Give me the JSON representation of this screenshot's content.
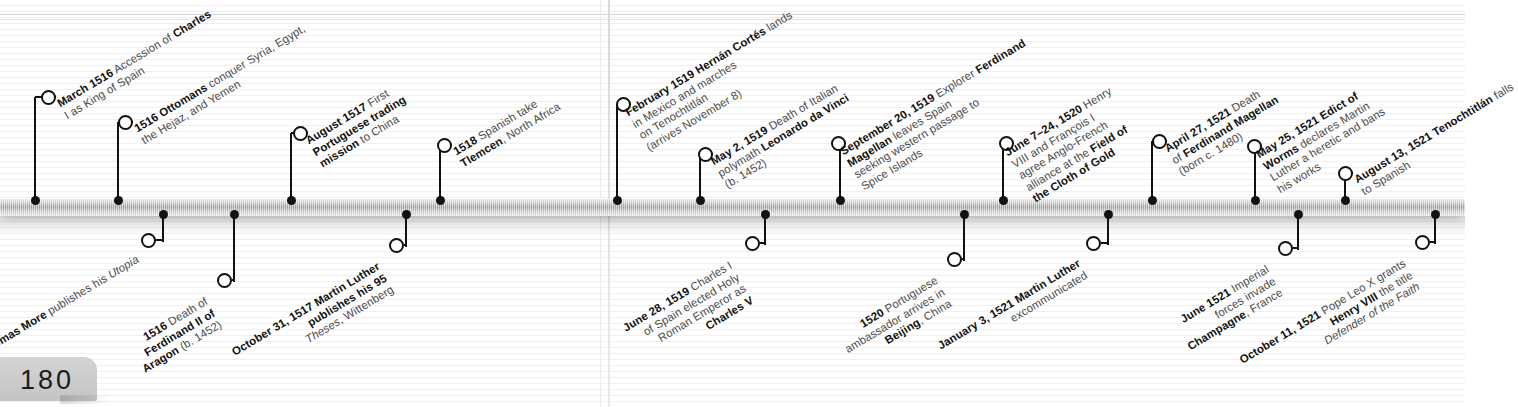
{
  "page": {
    "number": "180"
  },
  "timeline": {
    "orientation": "horizontal",
    "axis_color": "#9f9f9f",
    "accent_color": "#111111",
    "events": [
      {
        "id": "march-1516-charles",
        "side": "above",
        "dot_x": 35,
        "ring_x": 48,
        "ring_y": 97,
        "label_x": 62,
        "label_y": 97,
        "date": "March 1516",
        "lines": [
          "Accession of Charles",
          "I as King of Spain"
        ],
        "bold_spans": [
          "March 1516",
          "Charles"
        ]
      },
      {
        "id": "1516-ottomans",
        "side": "above",
        "dot_x": 118,
        "ring_x": 125,
        "ring_y": 122,
        "label_x": 139,
        "label_y": 122,
        "date": "1516 Ottomans",
        "lines": [
          "conquer Syria, Egypt,",
          "the Hejaz, and Yemen"
        ],
        "bold_spans": [
          "1516 Ottomans"
        ]
      },
      {
        "id": "august-1517-portuguese",
        "side": "above",
        "dot_x": 291,
        "ring_x": 300,
        "ring_y": 133,
        "label_x": 314,
        "label_y": 133,
        "date": "August 1517",
        "lines": [
          "First",
          "Portuguese trading",
          "mission to China"
        ],
        "bold_spans": [
          "August 1517",
          "Portuguese trading",
          "mission"
        ]
      },
      {
        "id": "1518-tlemcen",
        "side": "above",
        "dot_x": 440,
        "ring_x": 444,
        "ring_y": 145,
        "label_x": 458,
        "label_y": 145,
        "date": "1518",
        "lines": [
          "Spanish take",
          "Tlemcen, North Africa"
        ],
        "bold_spans": [
          "1518",
          "Tlemcen"
        ]
      },
      {
        "id": "february-1519-cortes",
        "side": "above",
        "dot_x": 617,
        "ring_x": 623,
        "ring_y": 104,
        "label_x": 637,
        "label_y": 104,
        "date": "February 1519",
        "lines": [
          "Hernán Cortés lands",
          "in Mexico and marches",
          "on Tenochtitlán",
          "(arrives November 8)"
        ],
        "bold_spans": [
          "February 1519",
          "Hernán Cortés"
        ]
      },
      {
        "id": "may-2-1519-davinci",
        "side": "above",
        "dot_x": 700,
        "ring_x": 705,
        "ring_y": 154,
        "label_x": 719,
        "label_y": 154,
        "date": "May 2, 1519",
        "lines": [
          "Death of Italian",
          "polymath Leonardo da Vinci",
          "(b. 1452)"
        ],
        "bold_spans": [
          "May 2, 1519",
          "Leonardo da Vinci"
        ]
      },
      {
        "id": "september-20-1519-magellan",
        "side": "above",
        "dot_x": 840,
        "ring_x": 838,
        "ring_y": 143,
        "label_x": 852,
        "label_y": 143,
        "date": "September 20, 1519",
        "lines": [
          "Explorer Ferdinand",
          "Magellan leaves Spain",
          "seeking western passage to",
          "Spice Islands"
        ],
        "bold_spans": [
          "September 20, 1519",
          "Ferdinand",
          "Magellan"
        ]
      },
      {
        "id": "june-7-24-1520-cloth-of-gold",
        "side": "above",
        "dot_x": 1003,
        "ring_x": 1006,
        "ring_y": 143,
        "label_x": 1020,
        "label_y": 143,
        "date": "June 7–24, 1520",
        "lines": [
          "Henry",
          "VIII and François I",
          "agree Anglo-French",
          "alliance at the Field of",
          "the Cloth of Gold"
        ],
        "bold_spans": [
          "June 7–24, 1520",
          "Field of",
          "the Cloth of Gold"
        ]
      },
      {
        "id": "april-27-1521-magellan-death",
        "side": "above",
        "dot_x": 1152,
        "ring_x": 1159,
        "ring_y": 141,
        "label_x": 1173,
        "label_y": 141,
        "date": "April 27, 1521",
        "lines": [
          "Death",
          "of Ferdinand Magellan",
          "(born c. 1480)"
        ],
        "bold_spans": [
          "April 27, 1521",
          "Ferdinand Magellan"
        ]
      },
      {
        "id": "may-25-1521-edict-of-worms",
        "side": "above",
        "dot_x": 1255,
        "ring_x": 1254,
        "ring_y": 146,
        "label_x": 1268,
        "label_y": 146,
        "date": "May 25, 1521",
        "lines": [
          "Edict of",
          "Worms declares Martin",
          "Luther a heretic and bans",
          "his works"
        ],
        "bold_spans": [
          "May 25, 1521",
          "Edict of",
          "Worms"
        ]
      },
      {
        "id": "august-13-1521-tenochtitlan",
        "side": "above",
        "dot_x": 1345,
        "ring_x": 1345,
        "ring_y": 173,
        "label_x": 1359,
        "label_y": 173,
        "date": "August 13, 1521",
        "lines": [
          "Tenochtitlán falls",
          "to Spanish"
        ],
        "bold_spans": [
          "August 13, 1521",
          "Tenochtitlán"
        ]
      },
      {
        "id": "1516-thomas-more-utopia",
        "side": "below",
        "dot_x": 163,
        "ring_x": 148,
        "ring_y": 240,
        "label_x": 138,
        "label_y": 252,
        "date": "1516 Thomas More",
        "lines": [
          "publishes his Utopia"
        ],
        "bold_spans": [
          "1516 Thomas More"
        ],
        "italic_spans": [
          "Utopia"
        ]
      },
      {
        "id": "1516-ferdinand-ii-death",
        "side": "below",
        "dot_x": 234,
        "ring_x": 224,
        "ring_y": 280,
        "label_x": 214,
        "label_y": 292,
        "date": "1516",
        "lines": [
          "Death of",
          "Ferdinand II of",
          "Aragon (b. 1452)"
        ],
        "bold_spans": [
          "1516",
          "Ferdinand II of",
          "Aragon"
        ]
      },
      {
        "id": "october-31-1517-luther-theses",
        "side": "below",
        "dot_x": 406,
        "ring_x": 396,
        "ring_y": 245,
        "label_x": 386,
        "label_y": 257,
        "date": "October 31, 1517",
        "lines": [
          "Martin Luther",
          "publishes his 95",
          "Theses, Wittenberg"
        ],
        "bold_spans": [
          "October 31, 1517",
          "Martin Luther",
          "publishes his 95"
        ],
        "italic_spans": [
          "Theses"
        ]
      },
      {
        "id": "june-28-1519-charles-v",
        "side": "below",
        "dot_x": 765,
        "ring_x": 752,
        "ring_y": 243,
        "label_x": 742,
        "label_y": 255,
        "date": "June 28, 1519",
        "lines": [
          "Charles I",
          "of Spain elected Holy",
          "Roman Emperor as",
          "Charles V"
        ],
        "bold_spans": [
          "June 28, 1519",
          "Charles V"
        ]
      },
      {
        "id": "1520-portuguese-beijing",
        "side": "below",
        "dot_x": 964,
        "ring_x": 954,
        "ring_y": 259,
        "label_x": 944,
        "label_y": 271,
        "date": "1520",
        "lines": [
          "Portuguese",
          "ambassador arrives in",
          "Beijing, China"
        ],
        "bold_spans": [
          "1520",
          "Beijing"
        ]
      },
      {
        "id": "january-3-1521-luther-excommunicated",
        "side": "below",
        "dot_x": 1108,
        "ring_x": 1093,
        "ring_y": 243,
        "label_x": 1083,
        "label_y": 255,
        "date": "January 3, 1521",
        "lines": [
          "Martin Luther",
          "excommunicated"
        ],
        "bold_spans": [
          "January 3, 1521",
          "Martin Luther"
        ]
      },
      {
        "id": "june-1521-champagne",
        "side": "below",
        "dot_x": 1298,
        "ring_x": 1285,
        "ring_y": 248,
        "label_x": 1275,
        "label_y": 260,
        "date": "June 1521",
        "lines": [
          "Imperial",
          "forces invade",
          "Champagne, France"
        ],
        "bold_spans": [
          "June 1521",
          "Champagne"
        ]
      },
      {
        "id": "october-11-1521-defender-of-the-faith",
        "side": "below",
        "dot_x": 1435,
        "ring_x": 1422,
        "ring_y": 242,
        "label_x": 1412,
        "label_y": 254,
        "date": "October 11, 1521",
        "lines": [
          "Pope Leo X grants",
          "Henry VIII the title",
          "Defender of the Faith"
        ],
        "bold_spans": [
          "October 11, 1521",
          "Henry VIII"
        ],
        "italic_spans": [
          "Defender of the Faith"
        ]
      }
    ]
  }
}
